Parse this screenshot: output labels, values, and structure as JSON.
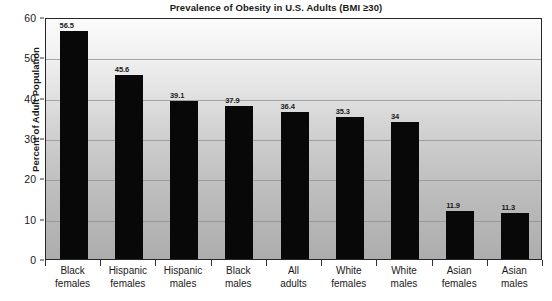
{
  "chart_data": {
    "type": "bar",
    "title": "Prevalence of Obesity in U.S. Adults (BMI ≥30)",
    "xlabel": "",
    "ylabel": "Percent of Adult Population",
    "ylim": [
      0,
      60
    ],
    "ytick_step": 10,
    "yticks": [
      "0",
      "10",
      "20",
      "30",
      "40",
      "50",
      "60"
    ],
    "grid": true,
    "legend": "none",
    "bar_color": "#080808",
    "plot_background": "#c0c0c0",
    "categories": [
      "Black females",
      "Hispanic females",
      "Hispanic males",
      "Black males",
      "All adults",
      "White females",
      "White males",
      "Asian females",
      "Asian males"
    ],
    "category_lines": [
      [
        "Black",
        "females"
      ],
      [
        "Hispanic",
        "females"
      ],
      [
        "Hispanic",
        "males"
      ],
      [
        "Black",
        "males"
      ],
      [
        "All",
        "adults"
      ],
      [
        "White",
        "females"
      ],
      [
        "White",
        "males"
      ],
      [
        "Asian",
        "females"
      ],
      [
        "Asian",
        "males"
      ]
    ],
    "values": [
      56.5,
      45.6,
      39.1,
      37.9,
      36.4,
      35.3,
      34,
      11.9,
      11.3
    ],
    "value_labels": [
      "56.5",
      "45.6",
      "39.1",
      "37.9",
      "36.4",
      "35.3",
      "34",
      "11.9",
      "11.3"
    ]
  }
}
